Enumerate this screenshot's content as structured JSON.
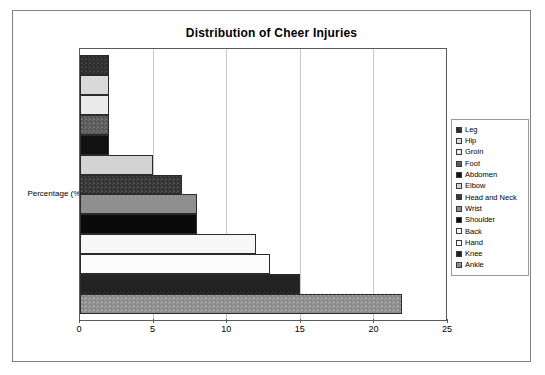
{
  "chart_data": {
    "type": "bar",
    "title": "Distribution of Cheer Injuries",
    "xlabel": "",
    "ylabel": "Percentage (%)",
    "orientation": "horizontal",
    "xlim": [
      0,
      25
    ],
    "xticks": [
      0,
      5,
      10,
      15,
      20,
      25
    ],
    "xtick_labels": [
      "0",
      "5",
      "10",
      "15",
      "20",
      "25"
    ],
    "grid": "vertical",
    "legend_position": "right",
    "categories": [
      "Leg",
      "Hip",
      "Groin",
      "Foot",
      "Abdomen",
      "Elbow",
      "Head and Neck",
      "Wrist",
      "Shoulder",
      "Back",
      "Hand",
      "Knee",
      "Ankle"
    ],
    "values": [
      2,
      2,
      2,
      2,
      2,
      5,
      7,
      8,
      8,
      12,
      13,
      15,
      22
    ],
    "bars_top_to_bottom": [
      {
        "label": "Leg",
        "value": 2,
        "fill": "f-dark-dither",
        "color": "#2f2f2f"
      },
      {
        "label": "Hip",
        "value": 2,
        "fill": "f-lightgrey",
        "color": "#d9d9d9"
      },
      {
        "label": "Groin",
        "value": 2,
        "fill": "f-verylight",
        "color": "#eaeaea"
      },
      {
        "label": "Foot",
        "value": 2,
        "fill": "f-midgrey-dither",
        "color": "#595959"
      },
      {
        "label": "Abdomen",
        "value": 2,
        "fill": "f-black",
        "color": "#111111"
      },
      {
        "label": "Elbow",
        "value": 5,
        "fill": "f-lightgrey2",
        "color": "#d3d3d3"
      },
      {
        "label": "Head and Neck",
        "value": 7,
        "fill": "f-darkgrey-dither",
        "color": "#343434"
      },
      {
        "label": "Wrist",
        "value": 8,
        "fill": "f-grey",
        "color": "#8f8f8f"
      },
      {
        "label": "Shoulder",
        "value": 8,
        "fill": "f-black2",
        "color": "#0a0a0a"
      },
      {
        "label": "Back",
        "value": 12,
        "fill": "f-white",
        "color": "#f7f7f7"
      },
      {
        "label": "Hand",
        "value": 13,
        "fill": "f-white2",
        "color": "#fbfbfb"
      },
      {
        "label": "Knee",
        "value": 15,
        "fill": "f-neardark",
        "color": "#232323"
      },
      {
        "label": "Ankle",
        "value": 22,
        "fill": "f-grey-dither",
        "color": "#8a8a8a"
      }
    ]
  },
  "legend": {
    "items": [
      {
        "label": "Leg",
        "fill": "f-dark-dither"
      },
      {
        "label": "Hip",
        "fill": "f-lightgrey"
      },
      {
        "label": "Groin",
        "fill": "f-verylight"
      },
      {
        "label": "Foot",
        "fill": "f-midgrey-dither"
      },
      {
        "label": "Abdomen",
        "fill": "f-black"
      },
      {
        "label": "Elbow",
        "fill": "f-lightgrey2"
      },
      {
        "label": "Head and Neck",
        "fill": "f-darkgrey-dither"
      },
      {
        "label": "Wrist",
        "fill": "f-grey"
      },
      {
        "label": "Shoulder",
        "fill": "f-black2"
      },
      {
        "label": "Back",
        "fill": "f-white"
      },
      {
        "label": "Hand",
        "fill": "f-white2"
      },
      {
        "label": "Knee",
        "fill": "f-neardark"
      },
      {
        "label": "Ankle",
        "fill": "f-grey-dither"
      }
    ]
  }
}
